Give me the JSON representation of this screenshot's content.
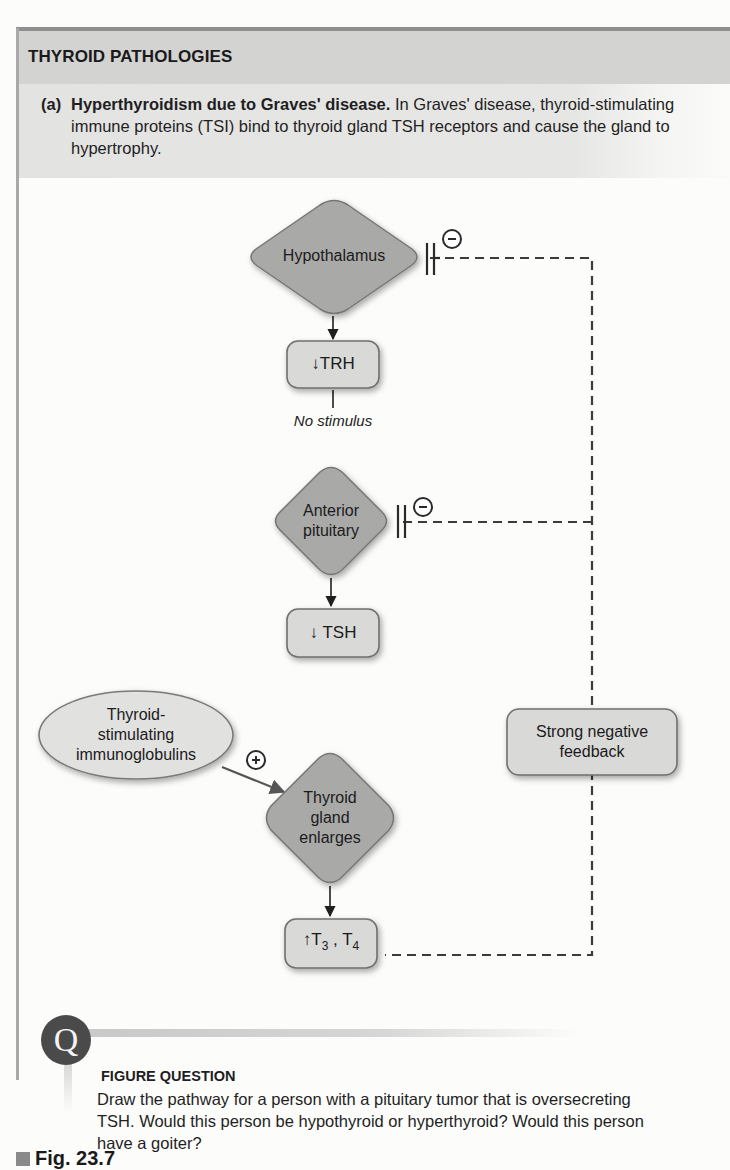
{
  "panel": {
    "title": "THYROID PATHOLOGIES",
    "description": {
      "prefix": "(a)",
      "lead": "Hyperthyroidism due to Graves' disease.",
      "text": " In Graves' disease, thyroid-stimulating immune proteins (TSI) bind to thyroid gland TSH receptors and cause the gland to hypertrophy."
    }
  },
  "diagram": {
    "nodes": {
      "hypothalamus": "Hypothalamus",
      "trh": {
        "arrow": "↓",
        "label": "TRH"
      },
      "no_stimulus": "No stimulus",
      "anterior_pituitary": [
        "Anterior",
        "pituitary"
      ],
      "tsh": {
        "arrow": "↓",
        "label": "TSH"
      },
      "tsi": [
        "Thyroid-",
        "stimulating",
        "immunoglobulins"
      ],
      "thyroid_gland": [
        "Thyroid",
        "gland",
        "enlarges"
      ],
      "t3t4": {
        "arrow": "↑",
        "t3": "T",
        "sub3": "3",
        "sep": " , ",
        "t4": "T",
        "sub4": "4"
      },
      "feedback": [
        "Strong negative",
        "feedback"
      ]
    },
    "symbols": {
      "inhibit": "−",
      "stimulate": "+"
    },
    "colors": {
      "diamond_fill": "#a9a9a8",
      "box_fill": "#d9d9d8",
      "ellipse_fill": "#e1e1e0",
      "stroke": "#6f6f6f",
      "dash": "#3b3b3b"
    }
  },
  "figure_question": {
    "icon": "Q",
    "heading": "FIGURE QUESTION",
    "text": "Draw the pathway for a person with a pituitary tumor that is oversecreting TSH. Would this person be hypothyroid or hyperthyroid? Would this person have a goiter?"
  },
  "figure_label": "Fig. 23.7"
}
